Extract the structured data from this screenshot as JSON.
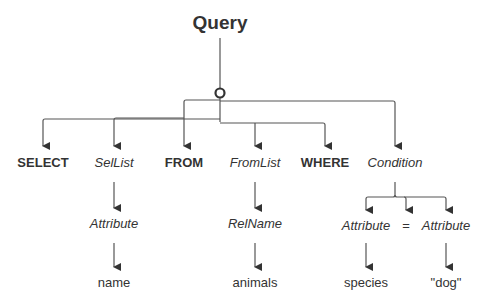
{
  "diagram": {
    "title": "Query",
    "colors": {
      "line": "#555555",
      "text": "#333333",
      "node_ring": "#333333"
    },
    "level1": [
      {
        "label": "SELECT",
        "kind": "keyword"
      },
      {
        "label": "SelList",
        "kind": "nonterminal"
      },
      {
        "label": "FROM",
        "kind": "keyword"
      },
      {
        "label": "FromList",
        "kind": "nonterminal"
      },
      {
        "label": "WHERE",
        "kind": "keyword"
      },
      {
        "label": "Condition",
        "kind": "nonterminal"
      }
    ],
    "level2": {
      "sellist_child": "Attribute",
      "fromlist_child": "RelName",
      "condition_children": [
        "Attribute",
        "=",
        "Attribute"
      ]
    },
    "level3": {
      "attribute_value": "name",
      "relname_value": "animals",
      "cond_left_value": "species",
      "cond_right_value": "\"dog\""
    }
  }
}
